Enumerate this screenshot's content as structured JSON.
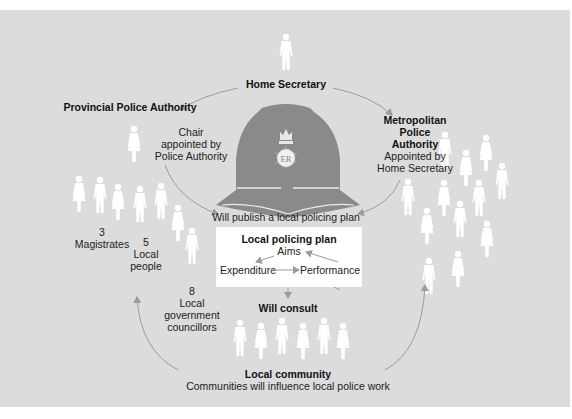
{
  "diagram": {
    "home_secretary": {
      "label": "Home Secretary"
    },
    "provincial": {
      "title": "Provincial Police Authority",
      "chair_note": [
        "Chair",
        "appointed by",
        "Police Authority"
      ],
      "members": [
        {
          "count": "3",
          "label": [
            "Magistrates"
          ]
        },
        {
          "count": "5",
          "label": [
            "Local",
            "people"
          ]
        },
        {
          "count": "8",
          "label": [
            "Local",
            "government",
            "councillors"
          ]
        }
      ]
    },
    "metropolitan": {
      "title": [
        "Metropolitan",
        "Police",
        "Authority"
      ],
      "note": [
        "Appointed by",
        "Home Secretary"
      ]
    },
    "helmet": {
      "badge_text": "ER",
      "icon": "police-helmet-icon"
    },
    "publish_text": "Will publish a local policing plan",
    "plan": {
      "title": "Local policing plan",
      "aims": "Aims",
      "expenditure": "Expenditure",
      "performance": "Performance"
    },
    "consult_text": "Will consult",
    "community": {
      "title": "Local community",
      "subtitle": "Communities will influence local police work"
    },
    "colors": {
      "background": "#dcdcdc",
      "helmet": "#8a8a8a",
      "figure": "#ffffff",
      "arrow": "#9a9a9a"
    }
  }
}
